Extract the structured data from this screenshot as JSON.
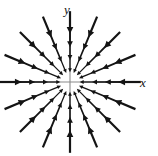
{
  "figure": {
    "title": "",
    "axis_labels": {
      "x": "x",
      "y": "y"
    },
    "colors": {
      "background": "#ffffff",
      "axis": "#8a8a8a",
      "arrow": "#141414",
      "label": "#141414"
    }
  },
  "chart_data": {
    "type": "scatter",
    "plot_kind": "vector-field",
    "title": "",
    "subtitle": "",
    "xlabel": "x",
    "ylabel": "y",
    "legend": [],
    "annotations": [],
    "grid": false,
    "axes_shown": true,
    "xlim": [
      -1.08,
      1.08
    ],
    "ylim": [
      -1.08,
      1.08
    ],
    "origin_px": [
      70,
      82
    ],
    "axis_extent_px": {
      "x_start": 8,
      "x_end": 136,
      "y_start": 19,
      "y_end": 150
    },
    "field_description": "Radial inward vector field (sink / attractor): every arrow points toward the origin with magnitude growing with distance from origin.",
    "field_formula": "F(x, y) = (-x, -y)",
    "ray_count": 16,
    "ring_count": 4,
    "ray_angles_deg": [
      0,
      22.5,
      45,
      67.5,
      90,
      112.5,
      135,
      157.5,
      180,
      202.5,
      225,
      247.5,
      270,
      292.5,
      315,
      337.5
    ],
    "ring_radii_norm": [
      0.27,
      0.5,
      0.73,
      0.96
    ],
    "arrow_length_norm": [
      0.15,
      0.19,
      0.22,
      0.24
    ],
    "arrow_direction": "inward",
    "total_arrows": 64,
    "axis_arrow_rows": {
      "left_axis_arrows": 4,
      "right_axis_arrows": 4,
      "up_axis_arrows": 4,
      "down_axis_arrows": 4
    }
  }
}
